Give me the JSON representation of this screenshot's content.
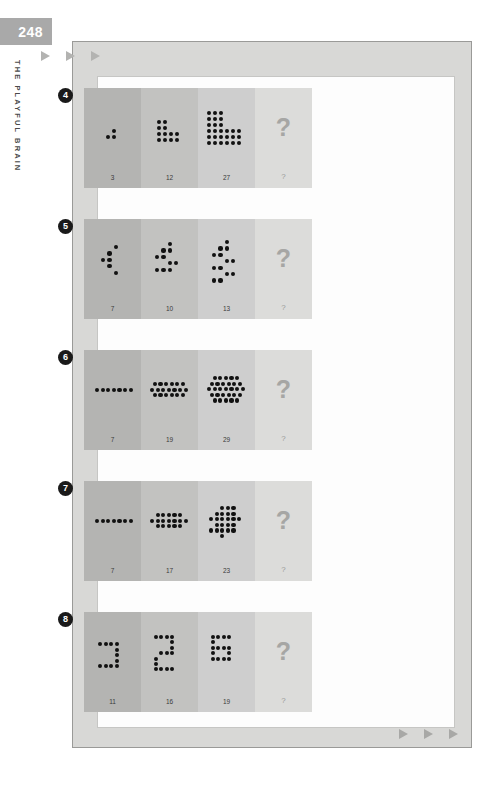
{
  "page": {
    "number": "248",
    "running_head": "THE PLAYFUL BRAIN"
  },
  "decor": {
    "top_arrows": [
      "arrow-right-icon",
      "arrow-right-icon",
      "arrow-right-icon"
    ],
    "bottom_arrows": [
      "arrow-right-icon",
      "arrow-right-icon",
      "arrow-right-icon"
    ],
    "unknown_mark": "?"
  },
  "puzzles": [
    {
      "badge": "4",
      "cells": [
        {
          "count": "3",
          "shape": "step-corner-1"
        },
        {
          "count": "12",
          "shape": "step-corner-2"
        },
        {
          "count": "27",
          "shape": "step-corner-3"
        },
        {
          "count": "?",
          "shape": "unknown"
        }
      ]
    },
    {
      "badge": "5",
      "cells": [
        {
          "count": "7",
          "shape": "chevron-1"
        },
        {
          "count": "10",
          "shape": "chevron-2"
        },
        {
          "count": "13",
          "shape": "chevron-3"
        },
        {
          "count": "?",
          "shape": "unknown"
        }
      ]
    },
    {
      "badge": "6",
      "cells": [
        {
          "count": "7",
          "shape": "hex-row-1"
        },
        {
          "count": "19",
          "shape": "hex-row-3"
        },
        {
          "count": "29",
          "shape": "hex-row-5"
        },
        {
          "count": "?",
          "shape": "unknown"
        }
      ]
    },
    {
      "badge": "7",
      "cells": [
        {
          "count": "7",
          "shape": "diamond-1"
        },
        {
          "count": "17",
          "shape": "diamond-2"
        },
        {
          "count": "23",
          "shape": "diamond-3"
        },
        {
          "count": "?",
          "shape": "unknown"
        }
      ]
    },
    {
      "badge": "8",
      "cells": [
        {
          "count": "11",
          "shape": "digit-glyph-1"
        },
        {
          "count": "16",
          "shape": "digit-glyph-2"
        },
        {
          "count": "19",
          "shape": "digit-glyph-3"
        },
        {
          "count": "?",
          "shape": "unknown"
        }
      ]
    }
  ],
  "dot_layouts": {
    "step-corner-1": {
      "size": 4.2,
      "step": 6.0,
      "ox": 22,
      "oy": 41,
      "cells": [
        [
          1,
          0
        ],
        [
          0,
          1
        ],
        [
          1,
          1
        ]
      ]
    },
    "step-corner-2": {
      "size": 4.2,
      "step": 6.0,
      "ox": 16,
      "oy": 32,
      "cells": [
        [
          0,
          0
        ],
        [
          1,
          0
        ],
        [
          0,
          1
        ],
        [
          1,
          1
        ],
        [
          0,
          2
        ],
        [
          1,
          2
        ],
        [
          2,
          2
        ],
        [
          3,
          2
        ],
        [
          0,
          3
        ],
        [
          1,
          3
        ],
        [
          2,
          3
        ],
        [
          3,
          3
        ]
      ]
    },
    "step-corner-3": {
      "size": 4.2,
      "step": 6.0,
      "ox": 9,
      "oy": 23,
      "cells": [
        [
          0,
          0
        ],
        [
          1,
          0
        ],
        [
          2,
          0
        ],
        [
          0,
          1
        ],
        [
          1,
          1
        ],
        [
          2,
          1
        ],
        [
          0,
          2
        ],
        [
          1,
          2
        ],
        [
          2,
          2
        ],
        [
          0,
          3
        ],
        [
          1,
          3
        ],
        [
          2,
          3
        ],
        [
          3,
          3
        ],
        [
          4,
          3
        ],
        [
          5,
          3
        ],
        [
          0,
          4
        ],
        [
          1,
          4
        ],
        [
          2,
          4
        ],
        [
          3,
          4
        ],
        [
          4,
          4
        ],
        [
          5,
          4
        ],
        [
          0,
          5
        ],
        [
          1,
          5
        ],
        [
          2,
          5
        ],
        [
          3,
          5
        ],
        [
          4,
          5
        ],
        [
          5,
          5
        ]
      ]
    },
    "chevron-1": {
      "size": 4.2,
      "step": 6.4,
      "ox": 17,
      "oy": 26,
      "cells": [
        [
          2,
          0
        ],
        [
          1,
          1
        ],
        [
          0,
          2
        ],
        [
          1,
          2
        ],
        [
          1,
          3
        ],
        [
          2,
          4
        ]
      ],
      "extra": [
        [
          2.0,
          0.0
        ]
      ]
    },
    "chevron-2": {
      "size": 4.2,
      "step": 6.4,
      "ox": 14,
      "oy": 23,
      "cells": [
        [
          2,
          0
        ],
        [
          1,
          1
        ],
        [
          2,
          1
        ],
        [
          0,
          2
        ],
        [
          1,
          2
        ],
        [
          2,
          3
        ],
        [
          3,
          3
        ],
        [
          0,
          4
        ],
        [
          1,
          4
        ],
        [
          2,
          4
        ]
      ]
    },
    "chevron-3": {
      "size": 4.2,
      "step": 6.4,
      "ox": 14,
      "oy": 21,
      "cells": [
        [
          2,
          0
        ],
        [
          1,
          1
        ],
        [
          2,
          1
        ],
        [
          0,
          2
        ],
        [
          1,
          2
        ],
        [
          2,
          3
        ],
        [
          3,
          3
        ],
        [
          0,
          4
        ],
        [
          1,
          4
        ],
        [
          2,
          5
        ],
        [
          3,
          5
        ],
        [
          0,
          6
        ],
        [
          1,
          6
        ]
      ]
    },
    "hex-row-1": {
      "size": 4.2,
      "step": 5.6,
      "ox": 11,
      "oy": 38,
      "cells": [
        [
          0,
          0
        ],
        [
          1,
          0
        ],
        [
          2,
          0
        ],
        [
          3,
          0
        ],
        [
          4,
          0
        ],
        [
          5,
          0
        ],
        [
          6,
          0
        ]
      ]
    },
    "hex-row-3": {
      "size": 4.2,
      "step": 5.6,
      "ox": 9,
      "oy": 32,
      "cells": [
        [
          0.5,
          0
        ],
        [
          1.5,
          0
        ],
        [
          2.5,
          0
        ],
        [
          3.5,
          0
        ],
        [
          4.5,
          0
        ],
        [
          5.5,
          0
        ],
        [
          0,
          1
        ],
        [
          1,
          1
        ],
        [
          2,
          1
        ],
        [
          3,
          1
        ],
        [
          4,
          1
        ],
        [
          5,
          1
        ],
        [
          6,
          1
        ],
        [
          0.5,
          2
        ],
        [
          1.5,
          2
        ],
        [
          2.5,
          2
        ],
        [
          3.5,
          2
        ],
        [
          4.5,
          2
        ],
        [
          5.5,
          2
        ]
      ]
    },
    "hex-row-5": {
      "size": 4.2,
      "step": 5.6,
      "ox": 9,
      "oy": 26,
      "cells": [
        [
          1,
          0
        ],
        [
          2,
          0
        ],
        [
          3,
          0
        ],
        [
          4,
          0
        ],
        [
          5,
          0
        ],
        [
          0.5,
          1
        ],
        [
          1.5,
          1
        ],
        [
          2.5,
          1
        ],
        [
          3.5,
          1
        ],
        [
          4.5,
          1
        ],
        [
          5.5,
          1
        ],
        [
          0,
          2
        ],
        [
          1,
          2
        ],
        [
          2,
          2
        ],
        [
          3,
          2
        ],
        [
          4,
          2
        ],
        [
          5,
          2
        ],
        [
          6,
          2
        ],
        [
          0.5,
          3
        ],
        [
          1.5,
          3
        ],
        [
          2.5,
          3
        ],
        [
          3.5,
          3
        ],
        [
          4.5,
          3
        ],
        [
          5.5,
          3
        ],
        [
          1,
          4
        ],
        [
          2,
          4
        ],
        [
          3,
          4
        ],
        [
          4,
          4
        ],
        [
          5,
          4
        ]
      ]
    },
    "diamond-1": {
      "size": 4.2,
      "step": 5.6,
      "ox": 11,
      "oy": 38,
      "cells": [
        [
          0,
          0
        ],
        [
          1,
          0
        ],
        [
          2,
          0
        ],
        [
          3,
          0
        ],
        [
          4,
          0
        ],
        [
          5,
          0
        ],
        [
          6,
          0
        ]
      ]
    },
    "diamond-2": {
      "size": 4.2,
      "step": 5.6,
      "ox": 9,
      "oy": 32,
      "cells": [
        [
          1,
          0
        ],
        [
          2,
          0
        ],
        [
          3,
          0
        ],
        [
          4,
          0
        ],
        [
          5,
          0
        ],
        [
          0,
          1
        ],
        [
          1,
          1
        ],
        [
          2,
          1
        ],
        [
          3,
          1
        ],
        [
          4,
          1
        ],
        [
          5,
          1
        ],
        [
          6,
          1
        ],
        [
          1,
          2
        ],
        [
          2,
          2
        ],
        [
          3,
          2
        ],
        [
          4,
          2
        ],
        [
          5,
          2
        ]
      ]
    },
    "diamond-3": {
      "size": 4.2,
      "step": 5.6,
      "ox": 11,
      "oy": 25,
      "cells": [
        [
          2,
          0
        ],
        [
          3,
          0
        ],
        [
          4,
          0
        ],
        [
          1,
          1
        ],
        [
          2,
          1
        ],
        [
          3,
          1
        ],
        [
          4,
          1
        ],
        [
          0,
          2
        ],
        [
          1,
          2
        ],
        [
          2,
          2
        ],
        [
          3,
          2
        ],
        [
          4,
          2
        ],
        [
          5,
          2
        ],
        [
          1,
          3
        ],
        [
          2,
          3
        ],
        [
          3,
          3
        ],
        [
          4,
          3
        ],
        [
          0,
          4
        ],
        [
          1,
          4
        ],
        [
          2,
          4
        ],
        [
          3,
          4
        ],
        [
          4,
          4
        ],
        [
          2,
          5
        ]
      ]
    },
    "digit-glyph-1": {
      "size": 4.0,
      "step": 5.6,
      "ox": 14,
      "oy": 30,
      "cells": [
        [
          0,
          0
        ],
        [
          1,
          0
        ],
        [
          2,
          0
        ],
        [
          3,
          0
        ],
        [
          3,
          1
        ],
        [
          3,
          2
        ],
        [
          3,
          3
        ],
        [
          0,
          4
        ],
        [
          1,
          4
        ],
        [
          2,
          4
        ],
        [
          3,
          4
        ]
      ]
    },
    "digit-glyph-2": {
      "size": 4.0,
      "step": 5.4,
      "ox": 13,
      "oy": 23,
      "cells": [
        [
          0,
          0
        ],
        [
          1,
          0
        ],
        [
          2,
          0
        ],
        [
          3,
          0
        ],
        [
          3,
          1
        ],
        [
          3,
          2
        ],
        [
          1,
          3
        ],
        [
          2,
          3
        ],
        [
          3,
          3
        ],
        [
          0,
          4
        ],
        [
          0,
          5
        ],
        [
          0,
          6
        ],
        [
          1,
          6
        ],
        [
          2,
          6
        ],
        [
          3,
          6
        ]
      ]
    },
    "digit-glyph-3": {
      "size": 4.0,
      "step": 5.4,
      "ox": 13,
      "oy": 23,
      "cells": [
        [
          0,
          0
        ],
        [
          1,
          0
        ],
        [
          2,
          0
        ],
        [
          3,
          0
        ],
        [
          0,
          1
        ],
        [
          0,
          2
        ],
        [
          1,
          2
        ],
        [
          2,
          2
        ],
        [
          3,
          2
        ],
        [
          0,
          3
        ],
        [
          3,
          3
        ],
        [
          0,
          4
        ],
        [
          1,
          4
        ],
        [
          2,
          4
        ],
        [
          3,
          4
        ]
      ]
    }
  }
}
